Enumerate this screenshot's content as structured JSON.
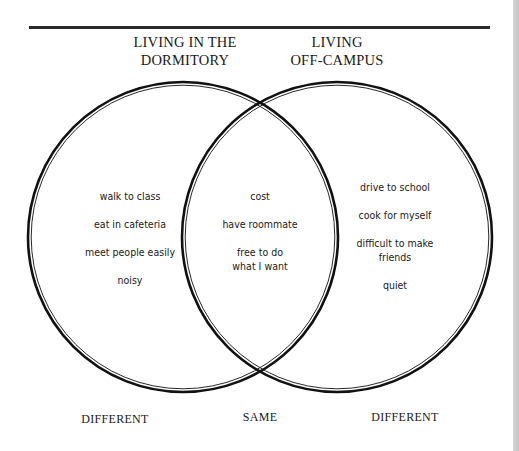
{
  "diagram": {
    "type": "venn",
    "circles": [
      {
        "id": "left",
        "title_lines": [
          "LIVING IN THE",
          "DORMITORY"
        ],
        "cx": 183,
        "cy": 237,
        "r": 155
      },
      {
        "id": "right",
        "title_lines": [
          "LIVING",
          "OFF-CAMPUS"
        ],
        "cx": 337,
        "cy": 237,
        "r": 155
      }
    ],
    "left_only": {
      "items": [
        "walk to class",
        "eat in cafeteria",
        "meet people easily",
        "noisy"
      ]
    },
    "overlap": {
      "items": [
        "cost",
        "have roommate",
        "free to do what I want"
      ],
      "items_lines": [
        [
          "cost"
        ],
        [
          "have roommate"
        ],
        [
          "free to do",
          "what I want"
        ]
      ]
    },
    "right_only": {
      "items": [
        "drive to school",
        "cook for myself",
        "difficult to make friends",
        "quiet"
      ],
      "items_lines": [
        [
          "drive to school"
        ],
        [
          "cook for myself"
        ],
        [
          "difficult to make",
          "friends"
        ],
        [
          "quiet"
        ]
      ]
    },
    "footer_labels": {
      "left": "DIFFERENT",
      "center": "SAME",
      "right": "DIFFERENT"
    },
    "colors": {
      "stroke": "#111111",
      "rule": "#2a2a2a",
      "text": "#1a1a1a",
      "background": "#ffffff"
    }
  }
}
